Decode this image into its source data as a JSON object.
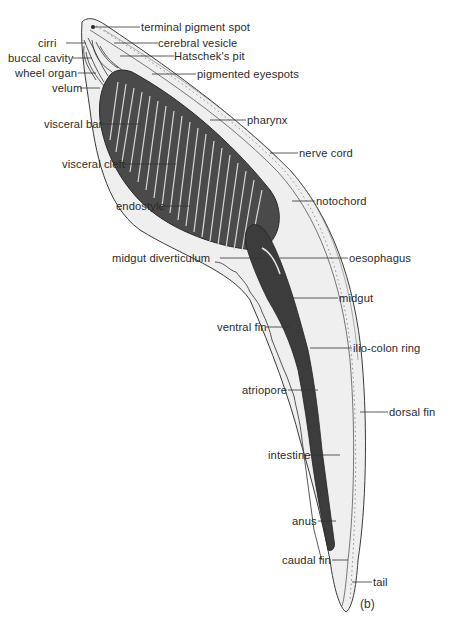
{
  "figure": {
    "caption": "(b)",
    "colors": {
      "background": "#ffffff",
      "outline": "#3a3a3a",
      "body_fill": "#ececec",
      "pharynx_fill": "#4a4a4a",
      "gut_fill": "#3c3c3c",
      "label_text": "#2b2b2b"
    }
  },
  "labels": {
    "left": [
      {
        "id": "cirri",
        "text": "cirri"
      },
      {
        "id": "buccal_cavity",
        "text": "buccal cavity"
      },
      {
        "id": "wheel_organ",
        "text": "wheel organ"
      },
      {
        "id": "velum",
        "text": "velum"
      },
      {
        "id": "visceral_bar",
        "text": "visceral bar"
      },
      {
        "id": "visceral_cleft",
        "text": "visceral cleft"
      },
      {
        "id": "endostyle",
        "text": "endostyle"
      },
      {
        "id": "midgut_diverticulum",
        "text": "midgut diverticulum"
      },
      {
        "id": "ventral_fin",
        "text": "ventral fin"
      },
      {
        "id": "atriopore",
        "text": "atriopore"
      },
      {
        "id": "intestine",
        "text": "intestine"
      },
      {
        "id": "anus",
        "text": "anus"
      },
      {
        "id": "caudal_fin",
        "text": "caudal fin"
      }
    ],
    "right": [
      {
        "id": "terminal_pigment_spot",
        "text": "terminal pigment spot"
      },
      {
        "id": "cerebral_vesicle",
        "text": "cerebral vesicle"
      },
      {
        "id": "hatscheks_pit",
        "text": "Hatschek's pit"
      },
      {
        "id": "pigmented_eyespots",
        "text": "pigmented eyespots"
      },
      {
        "id": "pharynx",
        "text": "pharynx"
      },
      {
        "id": "nerve_cord",
        "text": "nerve cord"
      },
      {
        "id": "notochord",
        "text": "notochord"
      },
      {
        "id": "oesophagus",
        "text": "oesophagus"
      },
      {
        "id": "midgut",
        "text": "midgut"
      },
      {
        "id": "ilio_colon_ring",
        "text": "ilio-colon ring"
      },
      {
        "id": "dorsal_fin",
        "text": "dorsal fin"
      },
      {
        "id": "tail",
        "text": "tail"
      }
    ]
  }
}
